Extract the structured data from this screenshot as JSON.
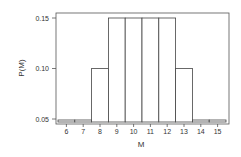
{
  "chart_data": {
    "type": "bar",
    "title": "",
    "xlabel": "M",
    "ylabel": "P(M)",
    "categories": [
      "6",
      "7",
      "8",
      "9",
      "10",
      "11",
      "12",
      "13",
      "14",
      "15"
    ],
    "values": [
      0.05,
      0.05,
      0.1,
      0.15,
      0.15,
      0.15,
      0.15,
      0.1,
      0.05,
      0.05
    ],
    "ylim": [
      0.045,
      0.155
    ],
    "yticks": [
      0.05,
      0.1,
      0.15
    ],
    "ytick_labels": [
      "0.05",
      "0.10",
      "0.15"
    ],
    "grid": false,
    "legend": null,
    "bar_fill": "#ffffff",
    "bar_edge": "#444444"
  }
}
